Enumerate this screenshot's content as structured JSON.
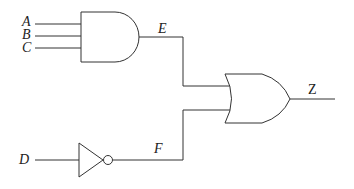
{
  "diagram": {
    "type": "logic-circuit",
    "inputs": [
      "A",
      "B",
      "C",
      "D"
    ],
    "intermediate": [
      "E",
      "F"
    ],
    "output": "Z",
    "gates": [
      {
        "id": "and1",
        "type": "AND",
        "inputs": [
          "A",
          "B",
          "C"
        ],
        "output": "E"
      },
      {
        "id": "not1",
        "type": "NOT",
        "inputs": [
          "D"
        ],
        "output": "F"
      },
      {
        "id": "or1",
        "type": "OR",
        "inputs": [
          "E",
          "F"
        ],
        "output": "Z"
      }
    ],
    "labels": {
      "A": "A",
      "B": "B",
      "C": "C",
      "D": "D",
      "E": "E",
      "F": "F",
      "Z": "Z"
    },
    "stroke_color": "#333333"
  }
}
